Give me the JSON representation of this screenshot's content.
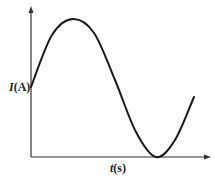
{
  "chart_data": {
    "type": "line",
    "title": "",
    "xlabel": "t(s)",
    "ylabel": "I(A)",
    "xlabel_var": "t",
    "xlabel_unit": "(s)",
    "ylabel_var": "I",
    "ylabel_unit": "(A)",
    "grid": false,
    "legend": null,
    "ticks": {
      "x": [],
      "y": []
    },
    "series": [
      {
        "name": "I(t)",
        "shape": "sine",
        "points_px": [
          [
            31,
            87
          ],
          [
            52,
            35
          ],
          [
            73,
            19
          ],
          [
            94,
            33
          ],
          [
            115,
            80
          ],
          [
            136,
            132
          ],
          [
            156,
            157
          ],
          [
            175,
            140
          ],
          [
            194,
            97
          ]
        ],
        "normalized": {
          "x": [
            0,
            0.12,
            0.24,
            0.36,
            0.48,
            0.6,
            0.72,
            0.83,
            0.94
          ],
          "y": [
            0.5,
            0.85,
            0.95,
            0.86,
            0.54,
            0.19,
            0.0,
            0.12,
            0.4
          ]
        }
      }
    ],
    "colors": {
      "curve": "#1a1a1a",
      "axes": "#333333"
    }
  }
}
